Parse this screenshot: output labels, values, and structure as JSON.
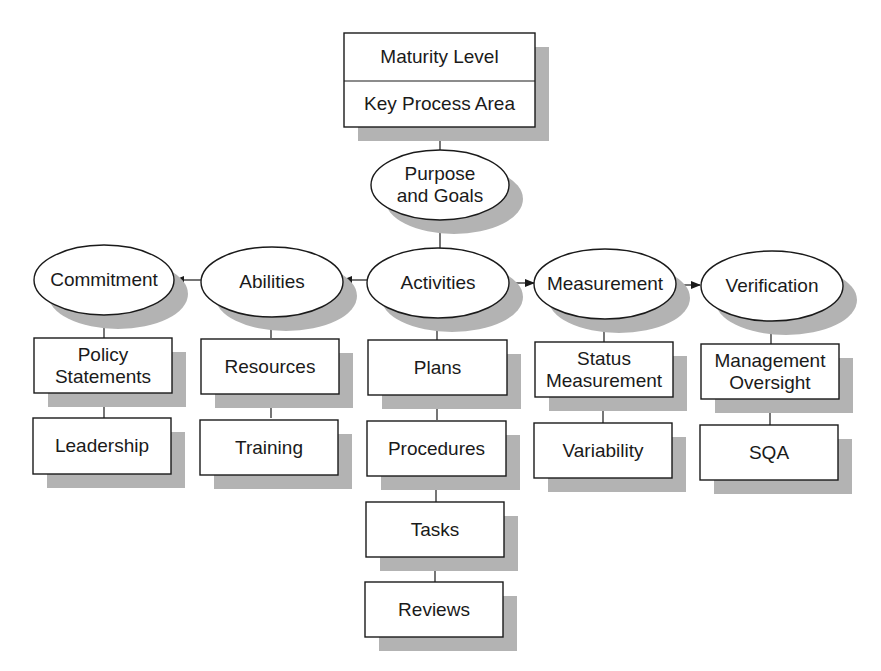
{
  "diagram": {
    "top_box": {
      "line1": "Maturity Level",
      "line2": "Key Process Area"
    },
    "purpose": {
      "label": "Purpose\nand Goals"
    },
    "categories": [
      {
        "id": "commitment",
        "label": "Commitment",
        "children": [
          "Policy\nStatements",
          "Leadership"
        ]
      },
      {
        "id": "abilities",
        "label": "Abilities",
        "children": [
          "Resources",
          "Training"
        ]
      },
      {
        "id": "activities",
        "label": "Activities",
        "children": [
          "Plans",
          "Procedures",
          "Tasks",
          "Reviews"
        ]
      },
      {
        "id": "measurement",
        "label": "Measurement",
        "children": [
          "Status\nMeasurement",
          "Variability"
        ]
      },
      {
        "id": "verification",
        "label": "Verification",
        "children": [
          "Management\nOversight",
          "SQA"
        ]
      }
    ],
    "arrows": [
      {
        "from": "Abilities",
        "to": "Commitment"
      },
      {
        "from": "Activities",
        "to": "Abilities"
      },
      {
        "from": "Activities",
        "to": "Measurement"
      },
      {
        "from": "Measurement",
        "to": "Verification"
      }
    ],
    "colors": {
      "stroke": "#1a1a1a",
      "shadow": "#b3b3b3",
      "fill": "#ffffff"
    }
  }
}
